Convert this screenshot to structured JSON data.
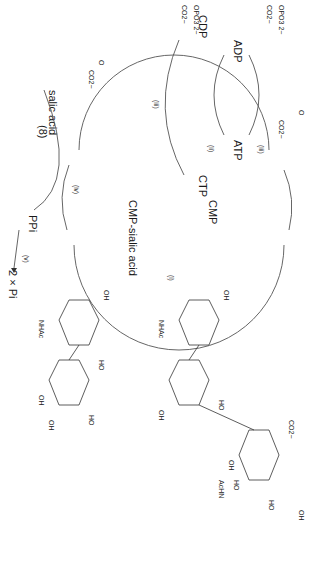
{
  "diagram": {
    "type": "chemical-reaction-cycle",
    "orientation": "rotated-90-clockwise",
    "line_color": "#555555",
    "text_color": "#1a1a1a",
    "background": "#ffffff",
    "compound_number": "(8)",
    "cycle_nodes": {
      "cmp": "CMP",
      "cdp": "CDP",
      "ctp": "CTP",
      "cmp_sialic": "CMP-sialic acid",
      "atp": "ATP",
      "adp": "ADP",
      "sialic_acid": "salic acid",
      "ppi": "PPi",
      "pi": "2 × Pi"
    },
    "reagents": {
      "pep_1": {
        "phosphate": "OPO3 2−",
        "carboxylate": "CO2−"
      },
      "pep_2": {
        "phosphate": "OPO3 2−",
        "carboxylate": "CO2−"
      },
      "pyruvate_1": {
        "carbonyl": "O",
        "carboxylate": "CO2−"
      },
      "pyruvate_2": {
        "carbonyl": "O",
        "carboxylate": "CO2−"
      }
    },
    "steps": [
      "(i)",
      "(ii)",
      "(iii)",
      "(iii)",
      "(iv)",
      "(v)"
    ],
    "substrate_labels": {
      "acceptor_oh_anomeric": "OH",
      "acceptor_nhac": "NHAc",
      "acceptor_labels": [
        "HO",
        "OH",
        "HO",
        "OH",
        "O",
        "HO",
        "OH",
        "O",
        "HO"
      ]
    },
    "product_labels": {
      "co2": "CO2−",
      "achn": "AcHN",
      "oh_labels": [
        "HO",
        "OH",
        "HO",
        "OH",
        "HO",
        "OH",
        "HO",
        "OH",
        "O",
        "O",
        "OH"
      ],
      "nhac": "NHAc",
      "anomeric_oh": "OH"
    }
  }
}
